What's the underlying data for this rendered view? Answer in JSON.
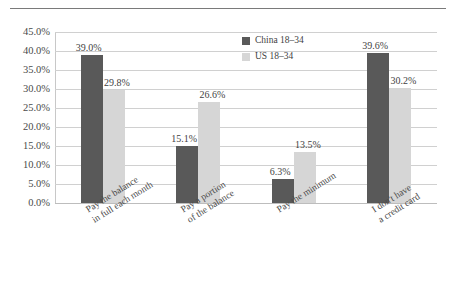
{
  "chart_data": {
    "type": "bar",
    "title": "",
    "xlabel": "",
    "ylabel": "",
    "ylim": [
      0,
      45
    ],
    "ytick_step": 5,
    "grid": true,
    "legend_position": "inside-top-center",
    "categories": [
      "Pay the balance in full each month",
      "Pay a portion of the balance",
      "Pay the minimum",
      "I don't have a credit card"
    ],
    "category_lines": [
      [
        "Pay the balance",
        "in full each month"
      ],
      [
        "Pay a portion",
        "of the balance"
      ],
      [
        "Pay the minimum"
      ],
      [
        "I don't have",
        "a credit card"
      ]
    ],
    "ytick_labels": [
      "0.0%",
      "5.0%",
      "10.0%",
      "15.0%",
      "20.0%",
      "25.0%",
      "30.0%",
      "35.0%",
      "40.0%",
      "45.0%"
    ],
    "series": [
      {
        "name": "China 18–34",
        "color": "#595959",
        "values": [
          39.0,
          15.1,
          6.3,
          39.6
        ],
        "labels": [
          "39.0%",
          "15.1%",
          "6.3%",
          "39.6%"
        ]
      },
      {
        "name": "US 18–34",
        "color": "#d6d6d6",
        "values": [
          29.8,
          26.6,
          13.5,
          30.2
        ],
        "labels": [
          "29.8%",
          "26.6%",
          "13.5%",
          "30.2%"
        ]
      }
    ]
  }
}
